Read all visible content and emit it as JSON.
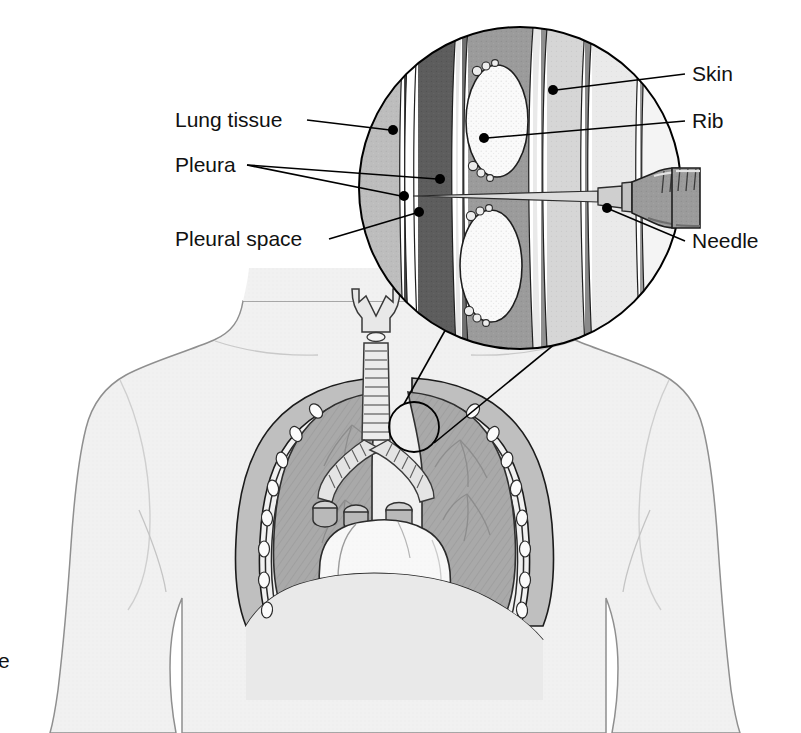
{
  "figure": {
    "background_color": "#ffffff"
  },
  "labels": {
    "lung_tissue": "Lung tissue",
    "pleura": "Pleura",
    "pleural_space": "Pleural space",
    "skin": "Skin",
    "rib": "Rib",
    "needle": "Needle",
    "clipped_left_text": "e"
  },
  "colors": {
    "outline": "#000000",
    "body_fill": "#f2f2f2",
    "body_outline": "#8a8a8a",
    "lung_fill": "#a9a9a9",
    "heart_fill": "#f7f7f7",
    "rib_white": "#fbfbfb",
    "inset_lung": "#bdbdbd",
    "inset_pleura_dark": "#5d5d5d",
    "inset_muscle": "#9b9b9b",
    "inset_fat": "#d8d8d8",
    "inset_skin": "#ececec",
    "needle_barrel": "#b4b4b4",
    "text": "#111111"
  },
  "inset": {
    "shape": "circle",
    "center_x": 520,
    "center_y": 188,
    "radius": 162,
    "description": "Magnified cross-section of chest wall layers with needle entering pleural space between two ribs",
    "layers": [
      "lung tissue",
      "visceral pleura",
      "pleural space",
      "parietal pleura",
      "intercostal muscle",
      "subcutaneous fat",
      "skin"
    ],
    "rib_count": 2
  },
  "torso": {
    "description": "Anterior chest view showing larynx, trachea, bronchi, both lungs, heart, ribs and diaphragm",
    "marker_circle": {
      "center_x": 414,
      "center_y": 427,
      "radius": 26
    },
    "parts": [
      "larynx",
      "trachea",
      "bronchi",
      "right lung",
      "left lung",
      "heart",
      "ribs",
      "diaphragm",
      "pleural membranes"
    ]
  },
  "annotations": [
    {
      "name": "lung-tissue",
      "text_x": 175,
      "text_y": 127,
      "dot_x": 393,
      "dot_y": 130,
      "anchor": "start"
    },
    {
      "name": "pleura",
      "text_x": 175,
      "text_y": 172,
      "dot_x": 440,
      "dot_y": 179,
      "anchor": "start"
    },
    {
      "name": "pleura-second",
      "dot_x": 404,
      "dot_y": 196,
      "anchor": "start"
    },
    {
      "name": "pleural-space",
      "text_x": 175,
      "text_y": 246,
      "dot_x": 419,
      "dot_y": 212,
      "anchor": "start"
    },
    {
      "name": "skin",
      "text_x": 692,
      "text_y": 81,
      "dot_x": 553,
      "dot_y": 90,
      "anchor": "start"
    },
    {
      "name": "rib",
      "text_x": 692,
      "text_y": 128,
      "dot_x": 484,
      "dot_y": 138,
      "anchor": "start"
    },
    {
      "name": "needle",
      "text_x": 692,
      "text_y": 248,
      "dot_x": 607,
      "dot_y": 208,
      "anchor": "start"
    }
  ]
}
